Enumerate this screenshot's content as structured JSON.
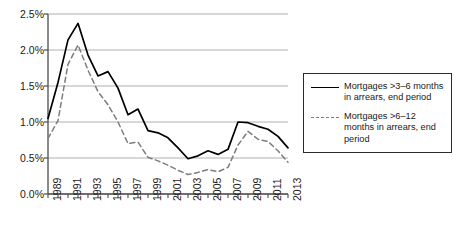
{
  "chart_data": {
    "type": "line",
    "title": "",
    "xlabel": "",
    "ylabel": "",
    "ylim": [
      0.0,
      2.5
    ],
    "ytick_values": [
      0.0,
      0.5,
      1.0,
      1.5,
      2.0,
      2.5
    ],
    "ytick_labels": [
      "0.0%",
      "0.5%",
      "1.0%",
      "1.5%",
      "2.0%",
      "2.5%"
    ],
    "grid": true,
    "grid_axis": "y",
    "legend_position": "right",
    "x": [
      1989,
      1990,
      1991,
      1992,
      1993,
      1994,
      1995,
      1996,
      1997,
      1998,
      1999,
      2000,
      2001,
      2002,
      2003,
      2004,
      2005,
      2006,
      2007,
      2008,
      2009,
      2010,
      2011,
      2012,
      2013
    ],
    "xtick_labels": [
      "1989",
      "1991",
      "1993",
      "1995",
      "1997",
      "1999",
      "2001",
      "2003",
      "2005",
      "2007",
      "2009",
      "2011",
      "2013"
    ],
    "xtick_label_values": [
      1989,
      1991,
      1993,
      1995,
      1997,
      1999,
      2001,
      2003,
      2005,
      2007,
      2009,
      2011,
      2013
    ],
    "xlim": [
      1989,
      2013
    ],
    "series": [
      {
        "name": "Mortgages >3–6 months in arrears, end period",
        "style": "solid",
        "color": "#000000",
        "values": [
          1.05,
          1.55,
          2.14,
          2.37,
          1.93,
          1.64,
          1.7,
          1.47,
          1.1,
          1.18,
          0.88,
          0.85,
          0.78,
          0.64,
          0.49,
          0.53,
          0.6,
          0.55,
          0.62,
          1.0,
          0.99,
          0.94,
          0.9,
          0.8,
          0.64
        ]
      },
      {
        "name": "Mortgages >6–12 months in arrears, end period",
        "style": "dashed",
        "color": "#7d7d7d",
        "values": [
          0.77,
          1.02,
          1.8,
          2.07,
          1.72,
          1.42,
          1.24,
          1.0,
          0.7,
          0.72,
          0.51,
          0.46,
          0.4,
          0.33,
          0.27,
          0.3,
          0.34,
          0.31,
          0.37,
          0.68,
          0.87,
          0.76,
          0.73,
          0.6,
          0.44
        ]
      }
    ]
  },
  "legend": {
    "entries": [
      {
        "label": "Mortgages >3–6 months\nin arrears, end period",
        "swatch": "solid-line-swatch"
      },
      {
        "label": "Mortgages >6–12\nmonths in arrears, end\nperiod",
        "swatch": "dashed-line-swatch"
      }
    ]
  },
  "colors": {
    "series_solid": "#000000",
    "series_dashed": "#7d7d7d",
    "gridline": "#b0b0b0",
    "axis": "#4d4d4d",
    "legend_border": "#2b2b2b",
    "background": "#ffffff"
  }
}
